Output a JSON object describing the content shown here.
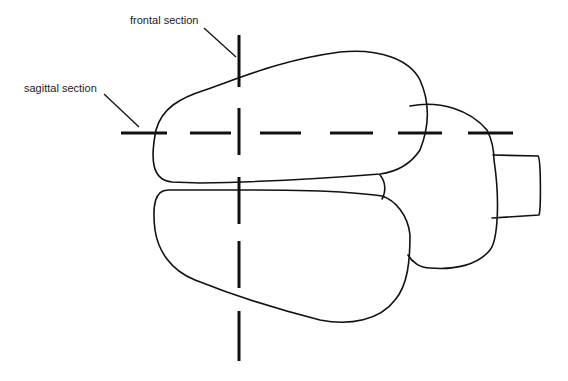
{
  "diagram": {
    "labels": {
      "frontal": "frontal section",
      "sagittal": "sagittal section"
    },
    "structures": [
      "left-hemisphere",
      "right-hemisphere",
      "cerebellum",
      "brainstem",
      "midline-wedge"
    ],
    "colors": {
      "stroke": "#111111",
      "background": "#ffffff",
      "text": "#1a1a1a"
    }
  }
}
